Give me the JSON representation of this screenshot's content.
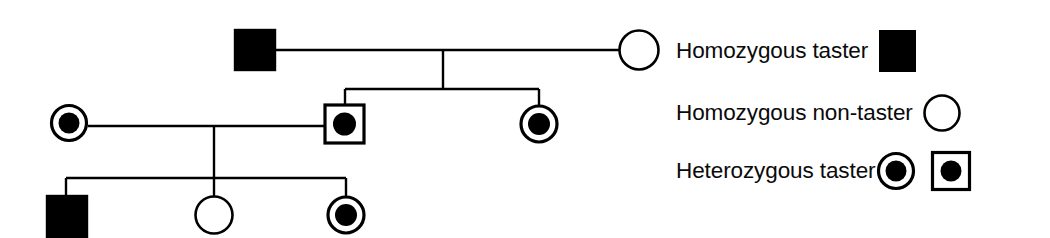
{
  "figure": {
    "background_color": "#ffffff",
    "stroke_color": "#000000",
    "fill_color": "#000000",
    "width": 1050,
    "height": 238
  },
  "legend": {
    "rows": [
      {
        "label": "Homozygous taster",
        "symbols": [
          "filled-square"
        ]
      },
      {
        "label": "Homozygous non-taster",
        "symbols": [
          "open-circle"
        ]
      },
      {
        "label": "Heterozygous taster",
        "symbols": [
          "circle-with-dot",
          "square-with-dot"
        ]
      }
    ]
  },
  "pedigree": {
    "generations": [
      {
        "id": "generation-1",
        "individuals": [
          {
            "id": "I-1",
            "shape": "square",
            "state": "filled",
            "sex": "male",
            "phenotype": "Homozygous taster",
            "cx": 255,
            "cy": 50
          },
          {
            "id": "I-2",
            "shape": "circle",
            "state": "open",
            "sex": "female",
            "phenotype": "Homozygous non-taster",
            "cx": 639,
            "cy": 50
          }
        ]
      },
      {
        "id": "generation-2",
        "individuals": [
          {
            "id": "II-1",
            "shape": "circle",
            "state": "dot",
            "sex": "female",
            "phenotype": "Heterozygous taster",
            "cx": 69,
            "cy": 123
          },
          {
            "id": "II-2",
            "shape": "square",
            "state": "dot",
            "sex": "male",
            "phenotype": "Heterozygous taster",
            "cx": 345,
            "cy": 124
          },
          {
            "id": "II-3",
            "shape": "circle",
            "state": "dot",
            "sex": "female",
            "phenotype": "Heterozygous taster",
            "cx": 539,
            "cy": 124
          }
        ]
      },
      {
        "id": "generation-3",
        "individuals": [
          {
            "id": "III-1",
            "shape": "square",
            "state": "filled",
            "sex": "male",
            "phenotype": "Homozygous taster",
            "cx": 67,
            "cy": 216
          },
          {
            "id": "III-2",
            "shape": "circle",
            "state": "open",
            "sex": "female",
            "phenotype": "Homozygous non-taster",
            "cx": 214,
            "cy": 215
          },
          {
            "id": "III-3",
            "shape": "circle",
            "state": "dot",
            "sex": "female",
            "phenotype": "Heterozygous taster",
            "cx": 346,
            "cy": 215
          }
        ]
      }
    ],
    "matings": [
      {
        "id": "mating-1",
        "partners": [
          "I-1",
          "I-2"
        ],
        "line_y": 50,
        "x1": 275,
        "x2": 620,
        "drop_x": 443,
        "sibship_y": 89,
        "children": [
          "II-2",
          "II-3"
        ]
      },
      {
        "id": "mating-2",
        "partners": [
          "II-1",
          "II-2"
        ],
        "line_y": 126,
        "x1": 88,
        "x2": 325,
        "drop_x": 214,
        "sibship_y": 178,
        "children": [
          "III-1",
          "III-2",
          "III-3"
        ]
      }
    ]
  }
}
